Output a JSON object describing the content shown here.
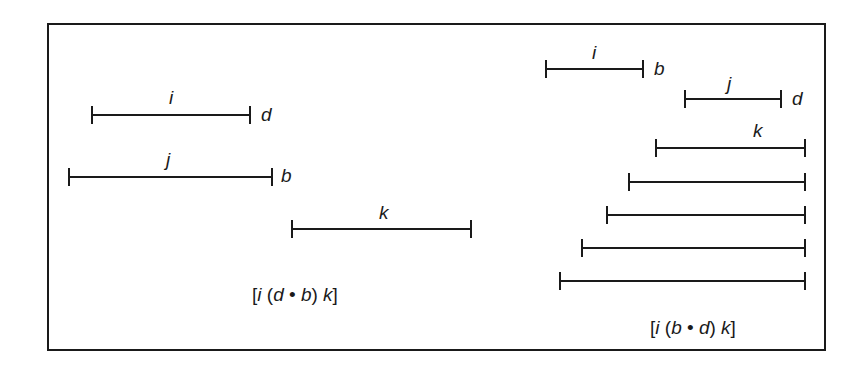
{
  "figure": {
    "left_panel": {
      "segments": [
        {
          "name": "i",
          "endpoint_label": "d"
        },
        {
          "name": "j",
          "endpoint_label": "b"
        },
        {
          "name": "k",
          "endpoint_label": ""
        }
      ],
      "formula": "[i (d • b) k]"
    },
    "right_panel": {
      "segments": [
        {
          "name": "i",
          "endpoint_label": "b"
        },
        {
          "name": "j",
          "endpoint_label": "d"
        },
        {
          "name": "k",
          "endpoint_label": ""
        }
      ],
      "unlabeled_bars": 4,
      "formula": "[i (b • d) k]"
    }
  },
  "colors": {
    "line": "#1a1a1a",
    "background": "#ffffff"
  }
}
